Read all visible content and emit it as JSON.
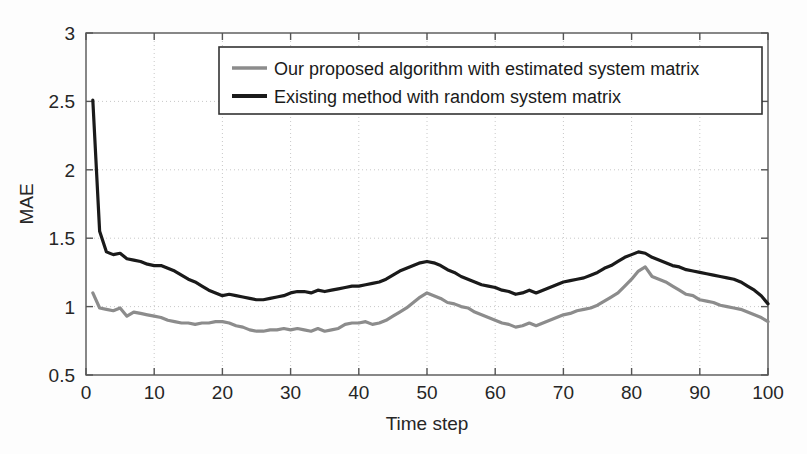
{
  "chart_data": {
    "type": "line",
    "title": "",
    "xlabel": "Time step",
    "ylabel": "MAE",
    "xlim": [
      0,
      100
    ],
    "ylim": [
      0.5,
      3
    ],
    "xticks": [
      0,
      10,
      20,
      30,
      40,
      50,
      60,
      70,
      80,
      90,
      100
    ],
    "yticks": [
      0.5,
      1,
      1.5,
      2,
      2.5,
      3
    ],
    "xtick_labels": [
      "0",
      "10",
      "20",
      "30",
      "40",
      "50",
      "60",
      "70",
      "80",
      "90",
      "100"
    ],
    "ytick_labels": [
      "0.5",
      "1",
      "1.5",
      "2",
      "2.5",
      "3"
    ],
    "grid": true,
    "grid_style": "dotted",
    "legend_position": "top-right",
    "x": [
      1,
      2,
      3,
      4,
      5,
      6,
      7,
      8,
      9,
      10,
      11,
      12,
      13,
      14,
      15,
      16,
      17,
      18,
      19,
      20,
      21,
      22,
      23,
      24,
      25,
      26,
      27,
      28,
      29,
      30,
      31,
      32,
      33,
      34,
      35,
      36,
      37,
      38,
      39,
      40,
      41,
      42,
      43,
      44,
      45,
      46,
      47,
      48,
      49,
      50,
      51,
      52,
      53,
      54,
      55,
      56,
      57,
      58,
      59,
      60,
      61,
      62,
      63,
      64,
      65,
      66,
      67,
      68,
      69,
      70,
      71,
      72,
      73,
      74,
      75,
      76,
      77,
      78,
      79,
      80,
      81,
      82,
      83,
      84,
      85,
      86,
      87,
      88,
      89,
      90,
      91,
      92,
      93,
      94,
      95,
      96,
      97,
      98,
      99,
      100
    ],
    "series": [
      {
        "name": "Our proposed algorithm with estimated system matrix",
        "color": "#8c8c8c",
        "linewidth": 3.2,
        "values": [
          1.1,
          0.99,
          0.98,
          0.97,
          0.99,
          0.93,
          0.96,
          0.95,
          0.94,
          0.93,
          0.92,
          0.9,
          0.89,
          0.88,
          0.88,
          0.87,
          0.88,
          0.88,
          0.89,
          0.89,
          0.88,
          0.86,
          0.85,
          0.83,
          0.82,
          0.82,
          0.83,
          0.83,
          0.84,
          0.83,
          0.84,
          0.83,
          0.82,
          0.84,
          0.82,
          0.83,
          0.84,
          0.87,
          0.88,
          0.88,
          0.89,
          0.87,
          0.88,
          0.9,
          0.93,
          0.96,
          0.99,
          1.03,
          1.07,
          1.1,
          1.08,
          1.06,
          1.03,
          1.02,
          1.0,
          0.99,
          0.96,
          0.94,
          0.92,
          0.9,
          0.88,
          0.87,
          0.85,
          0.86,
          0.88,
          0.86,
          0.88,
          0.9,
          0.92,
          0.94,
          0.95,
          0.97,
          0.98,
          0.99,
          1.01,
          1.04,
          1.07,
          1.1,
          1.15,
          1.2,
          1.26,
          1.29,
          1.22,
          1.2,
          1.18,
          1.15,
          1.12,
          1.09,
          1.08,
          1.05,
          1.04,
          1.03,
          1.01,
          1.0,
          0.99,
          0.98,
          0.96,
          0.94,
          0.92,
          0.89
        ]
      },
      {
        "name": "Existing method with random system matrix",
        "color": "#1a1a1a",
        "linewidth": 3.2,
        "values": [
          2.51,
          1.55,
          1.4,
          1.38,
          1.39,
          1.35,
          1.34,
          1.33,
          1.31,
          1.3,
          1.3,
          1.28,
          1.26,
          1.23,
          1.2,
          1.18,
          1.15,
          1.12,
          1.1,
          1.08,
          1.09,
          1.08,
          1.07,
          1.06,
          1.05,
          1.05,
          1.06,
          1.07,
          1.08,
          1.1,
          1.11,
          1.11,
          1.1,
          1.12,
          1.11,
          1.12,
          1.13,
          1.14,
          1.15,
          1.15,
          1.16,
          1.17,
          1.18,
          1.2,
          1.23,
          1.26,
          1.28,
          1.3,
          1.32,
          1.33,
          1.32,
          1.3,
          1.27,
          1.25,
          1.22,
          1.2,
          1.18,
          1.16,
          1.15,
          1.14,
          1.12,
          1.11,
          1.09,
          1.1,
          1.12,
          1.1,
          1.12,
          1.14,
          1.16,
          1.18,
          1.19,
          1.2,
          1.21,
          1.23,
          1.25,
          1.28,
          1.3,
          1.33,
          1.36,
          1.38,
          1.4,
          1.39,
          1.36,
          1.34,
          1.32,
          1.3,
          1.29,
          1.27,
          1.26,
          1.25,
          1.24,
          1.23,
          1.22,
          1.21,
          1.2,
          1.18,
          1.15,
          1.12,
          1.08,
          1.02
        ]
      }
    ]
  },
  "legend": {
    "entries": [
      {
        "label": "Our proposed algorithm with estimated system matrix",
        "color": "#8c8c8c"
      },
      {
        "label": "Existing method with random system matrix",
        "color": "#1a1a1a"
      }
    ]
  },
  "axes": {
    "x_label": "Time step",
    "y_label": "MAE"
  }
}
